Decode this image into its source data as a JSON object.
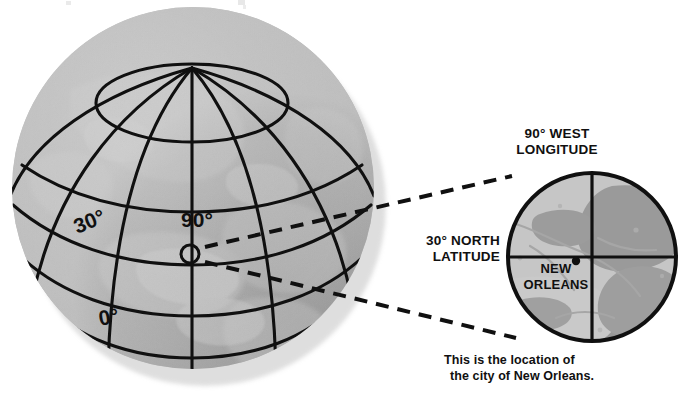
{
  "figure": {
    "type": "illustration",
    "background_color": "#ffffff",
    "ink_color": "#101010"
  },
  "globe": {
    "name": "earth-globe",
    "sphere_color": "#a8a8a8",
    "land_color": "#b8b8b8",
    "shadow_color": "#8f8f8f",
    "grid_color": "#101010",
    "center": {
      "x": 193,
      "y": 188
    },
    "radius": 181,
    "pole": {
      "x": 192,
      "y": 68
    },
    "labels": [
      {
        "name": "latitude-30-label",
        "text": "30°",
        "x": 92,
        "y": 228,
        "rotation": -22,
        "size": 21
      },
      {
        "name": "longitude-90-label",
        "text": "90°",
        "x": 197,
        "y": 227,
        "rotation": 0,
        "size": 21
      },
      {
        "name": "latitude-0-label",
        "text": "0°",
        "x": 110,
        "y": 324,
        "rotation": -10,
        "size": 21
      }
    ],
    "marker": {
      "name": "new-orleans-globe-marker",
      "x": 190,
      "y": 254,
      "radius": 9,
      "label": "New Orleans location marker"
    }
  },
  "connectors": {
    "name": "magnifier-connector-lines",
    "style": "dashed",
    "dash": "13 9",
    "width": 4,
    "color": "#101010",
    "lines": [
      {
        "name": "connector-upper",
        "x1": 205,
        "y1": 247,
        "x2": 512,
        "y2": 176
      },
      {
        "name": "connector-lower",
        "x1": 205,
        "y1": 262,
        "x2": 516,
        "y2": 338
      }
    ]
  },
  "inset": {
    "name": "new-orleans-detail-inset",
    "center": {
      "x": 592,
      "y": 257
    },
    "radius": 84,
    "outline_color": "#101010",
    "outline_width": 4,
    "water_color": "#9a9a9a",
    "land_color": "#c6c6c6",
    "crosshair": {
      "name": "inset-crosshair",
      "vertical_label": "90° West Longitude meridian",
      "horizontal_label": "30° North Latitude parallel",
      "color": "#101010",
      "width": 3.2
    },
    "labels": {
      "longitude": {
        "name": "longitude-callout",
        "line1": "90° WEST",
        "line2": "LONGITUDE",
        "x": 557,
        "y1": 138,
        "y2": 154,
        "anchor": "middle"
      },
      "latitude": {
        "name": "latitude-callout",
        "line1": "30° NORTH",
        "line2": "LATITUDE",
        "x": 500,
        "y1": 245,
        "y2": 261,
        "anchor": "end"
      },
      "city": {
        "name": "city-label",
        "line1": "NEW",
        "line2": "ORLEANS",
        "x": 556,
        "y1": 273,
        "y2": 289,
        "anchor": "middle"
      }
    },
    "city_dot": {
      "name": "new-orleans-city-dot",
      "x": 576,
      "y": 261,
      "radius": 4.2
    }
  },
  "caption": {
    "name": "figure-caption",
    "line1": "This is the location of",
    "line2": "the city of New Orleans.",
    "x": 444,
    "y1": 364,
    "y2": 380
  }
}
